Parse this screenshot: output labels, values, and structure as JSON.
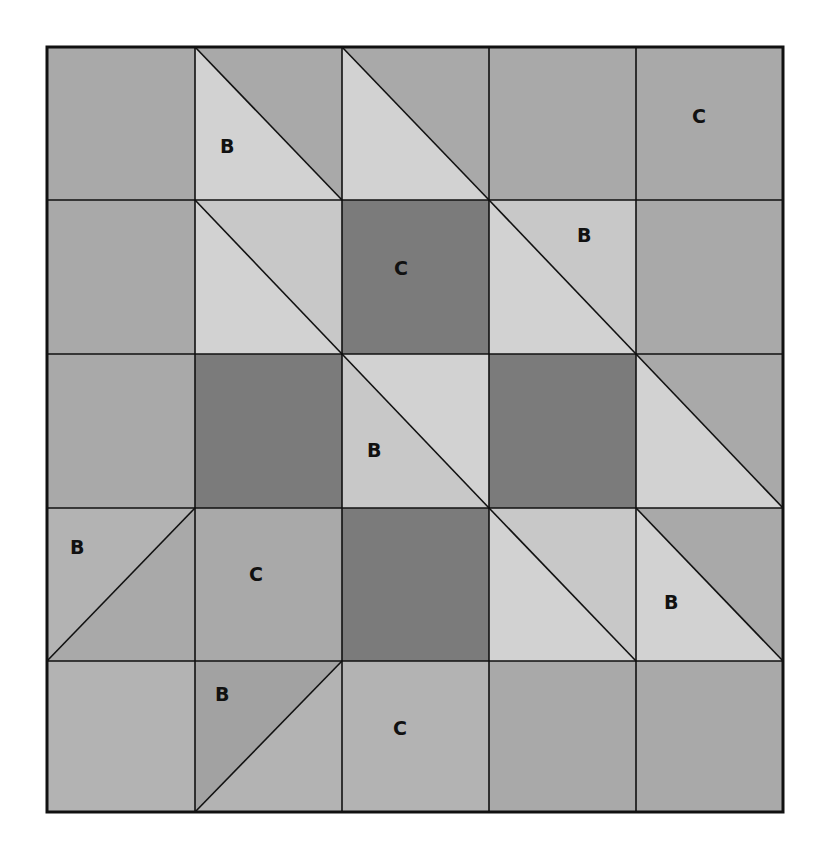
{
  "diagram": {
    "type": "quilt-block",
    "grid": {
      "rows": 5,
      "cols": 5
    },
    "colors": {
      "medium": "#a9a9a9",
      "medium_light": "#b3b3b3",
      "light": "#d2d2d2",
      "light2": "#c8c8c8",
      "dark": "#7b7b7b",
      "line": "#111111"
    },
    "labels": [
      {
        "text": "B",
        "row": 0,
        "col": 1,
        "x": 227,
        "y": 153
      },
      {
        "text": "C",
        "row": 0,
        "col": 4,
        "x": 699,
        "y": 123
      },
      {
        "text": "C",
        "row": 1,
        "col": 2,
        "x": 401,
        "y": 275
      },
      {
        "text": "B",
        "row": 1,
        "col": 3,
        "x": 584,
        "y": 242
      },
      {
        "text": "B",
        "row": 2,
        "col": 2,
        "x": 374,
        "y": 457
      },
      {
        "text": "B",
        "row": 3,
        "col": 0,
        "x": 77,
        "y": 554
      },
      {
        "text": "C",
        "row": 3,
        "col": 1,
        "x": 256,
        "y": 581
      },
      {
        "text": "B",
        "row": 3,
        "col": 4,
        "x": 671,
        "y": 609
      },
      {
        "text": "B",
        "row": 4,
        "col": 1,
        "x": 222,
        "y": 701
      },
      {
        "text": "C",
        "row": 4,
        "col": 2,
        "x": 400,
        "y": 735
      }
    ]
  }
}
